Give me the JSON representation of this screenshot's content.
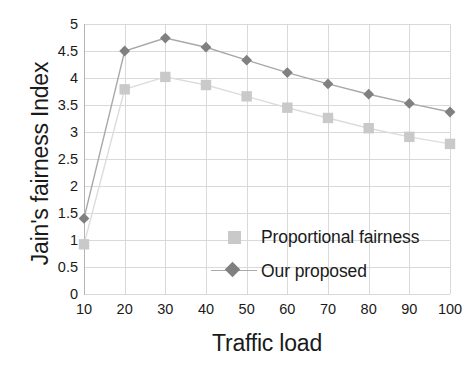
{
  "chart_data": {
    "type": "line",
    "title": "",
    "xlabel": "Traffic load",
    "ylabel": "Jain's fairness Index",
    "x": [
      10,
      20,
      30,
      40,
      50,
      60,
      70,
      80,
      90,
      100
    ],
    "categories": [
      "10",
      "20",
      "30",
      "40",
      "50",
      "60",
      "70",
      "80",
      "90",
      "100"
    ],
    "xlim": [
      10,
      100
    ],
    "ylim": [
      0,
      5
    ],
    "xticks": [
      "10",
      "20",
      "30",
      "40",
      "50",
      "60",
      "70",
      "80",
      "90",
      "100"
    ],
    "yticks": [
      "0",
      "0.5",
      "1",
      "1.5",
      "2",
      "2.5",
      "3",
      "3.5",
      "4",
      "4.5",
      "5"
    ],
    "ytick_values": [
      0,
      0.5,
      1,
      1.5,
      2,
      2.5,
      3,
      3.5,
      4,
      4.5,
      5
    ],
    "grid": true,
    "legend_position": "inside-center-right",
    "series": [
      {
        "name": "Proportional fairness",
        "marker": "square",
        "color": "#c9c9c9",
        "line_color": "#dcdcdc",
        "values": [
          0.92,
          3.79,
          4.02,
          3.87,
          3.66,
          3.45,
          3.26,
          3.07,
          2.91,
          2.78
        ]
      },
      {
        "name": "Our proposed",
        "marker": "diamond",
        "color": "#808080",
        "line_color": "#a8a8a8",
        "values": [
          1.4,
          4.5,
          4.74,
          4.57,
          4.33,
          4.1,
          3.89,
          3.7,
          3.53,
          3.37
        ]
      }
    ]
  },
  "legend": {
    "items": [
      {
        "label": "Proportional fairness"
      },
      {
        "label": "Our proposed"
      }
    ]
  },
  "colors": {
    "grid": "#d9d9d9",
    "axis": "#b3b3b3",
    "text": "#1a1a1a",
    "series_light": "#c9c9c9",
    "series_dark": "#808080"
  }
}
